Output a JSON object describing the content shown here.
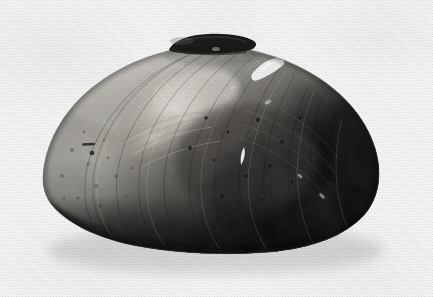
{
  "image": {
    "kind": "photograph",
    "subject": "freshwater mussel shell (bivalve) exterior, left valve",
    "view": "lateral exterior view, umbo/hinge uppermost",
    "orientation": "anterior end at left, posterior end at right",
    "medium": "black and white halftone print photograph",
    "width_px": 433,
    "height_px": 297
  },
  "palette": {
    "background": "#fafafa",
    "background_shadow": "#f0f0f0",
    "shell_lightest": "#d8d6d1",
    "shell_highlight": "#e8e6e1",
    "shell_light_gray": "#b6b3ad",
    "shell_mid_gray": "#8c8882",
    "shell_dark_gray": "#4e4b47",
    "shell_darkest": "#161513",
    "hinge_black": "#0d0d0c",
    "chip_white": "#fdfdfb"
  },
  "specimen": {
    "outline": {
      "left_edge_x": 42,
      "right_edge_x": 381,
      "top_edge_y": 36,
      "bottom_edge_y": 253,
      "shape": "broad ovate, strongly inflated, dorsal margin arched, ventral margin gently convex"
    },
    "regions": [
      {
        "name": "anterior-end",
        "label": "Anterior margin",
        "tone": "medium gray, mottled and pitted",
        "cx": 80,
        "cy": 165
      },
      {
        "name": "umbo-highlight",
        "label": "Umbonal specular highlight",
        "tone": "bright near-white sheen with growth striae",
        "cx": 170,
        "cy": 105
      },
      {
        "name": "central-disc",
        "label": "Central disc",
        "tone": "dark gray with fine concentric growth lines",
        "cx": 240,
        "cy": 155
      },
      {
        "name": "posterior-end",
        "label": "Posterior margin",
        "tone": "very dark, near black, heavy concentric rings",
        "cx": 330,
        "cy": 150
      },
      {
        "name": "ventral-margin",
        "label": "Ventral margin",
        "tone": "black band along lower edge",
        "cx": 220,
        "cy": 235
      }
    ],
    "features": [
      {
        "name": "hinge-ligament",
        "label": "Hinge ligament / dorsal beak projection",
        "description": "dark near-black bar protruding above the dorsal margin",
        "x": 168,
        "y": 35,
        "w": 86,
        "h": 16
      },
      {
        "name": "dorsal-chip",
        "label": "Chipped periostracum (white)",
        "description": "bright white eroded patch on the posterior dorsal slope",
        "x": 255,
        "y": 58,
        "w": 30,
        "h": 18
      },
      {
        "name": "central-scratch",
        "label": "White scratch on central disc",
        "description": "small elongate white mark",
        "x": 241,
        "y": 148,
        "w": 5,
        "h": 17
      },
      {
        "name": "anterior-pit",
        "label": "Dark erosion pit",
        "description": "small dark dash and dot on the anterior slope",
        "x": 84,
        "y": 144,
        "w": 10,
        "h": 4
      },
      {
        "name": "growth-lines",
        "label": "Concentric growth lines",
        "description": "closely spaced concentric rings following the ventral and posterior margins"
      }
    ]
  },
  "caption": {
    "visible": false,
    "text": ""
  }
}
